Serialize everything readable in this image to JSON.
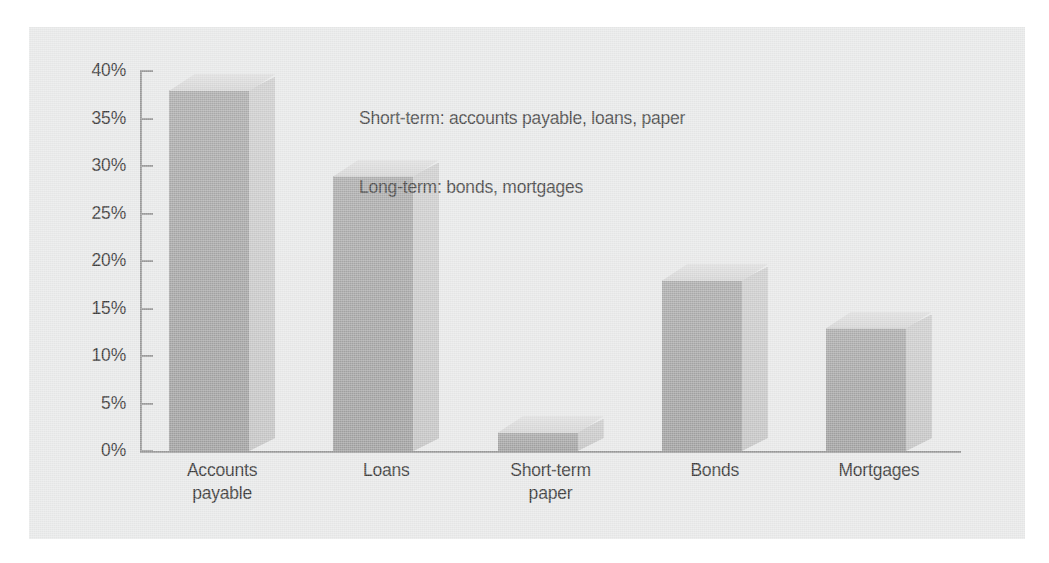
{
  "chart_data": {
    "type": "bar",
    "title": "",
    "subtitle": "",
    "xlabel": "",
    "ylabel": "",
    "categories": [
      "Accounts payable",
      "Loans",
      "Short-term paper",
      "Bonds",
      "Mortgages"
    ],
    "values": [
      38,
      29,
      2,
      18,
      13
    ],
    "value_labels": [
      "38%",
      "29%",
      "2%",
      "18%",
      "13%"
    ],
    "ylim": [
      0,
      40
    ],
    "ytick_values": [
      40,
      35,
      30,
      25,
      20,
      15,
      10,
      5,
      0
    ],
    "ytick_labels": [
      "40%",
      "35%",
      "30%",
      "25%",
      "20%",
      "15%",
      "10%",
      "5%",
      "0%"
    ],
    "grid": false,
    "legend": false,
    "legend_position": "none",
    "style": "3d-bars",
    "annotations": [
      "Short-term: accounts payable, loans, paper",
      "Long-term: bonds, mortgages"
    ],
    "colors": {
      "panel_background": "#e8e9e9",
      "page_background": "#ffffff",
      "bar_front": "#a9a9a9",
      "bar_side": "#c9c9c9",
      "bar_top": "#dcdcdc",
      "axis_line": "#9a9a9a",
      "text": "#3a3a3a",
      "annotation_text": "#4a4a4a"
    }
  },
  "axis": {
    "ticks": [
      {
        "label": "40%",
        "value": 40
      },
      {
        "label": "35%",
        "value": 35
      },
      {
        "label": "30%",
        "value": 30
      },
      {
        "label": "25%",
        "value": 25
      },
      {
        "label": "20%",
        "value": 20
      },
      {
        "label": "15%",
        "value": 15
      },
      {
        "label": "10%",
        "value": 10
      },
      {
        "label": "5%",
        "value": 5
      },
      {
        "label": "0%",
        "value": 0
      }
    ]
  },
  "categories": [
    {
      "line1": "Accounts",
      "line2": "payable"
    },
    {
      "line1": "Loans",
      "line2": ""
    },
    {
      "line1": "Short-term",
      "line2": "paper"
    },
    {
      "line1": "Bonds",
      "line2": ""
    },
    {
      "line1": "Mortgages",
      "line2": ""
    }
  ],
  "annotation": {
    "line1": "Short-term: accounts payable, loans, paper",
    "line2": "Long-term: bonds, mortgages"
  }
}
